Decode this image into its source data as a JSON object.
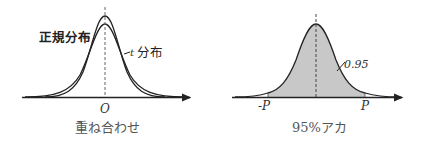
{
  "left_panel": {
    "normal_label": "正規分布",
    "t_label": "t",
    "t_label_suffix": "分布",
    "origin_label": "O",
    "caption": "重ね合わせ"
  },
  "right_panel": {
    "area_label": "0.95",
    "neg_p_label": "-P",
    "p_label": "P",
    "caption": "95%アカ"
  },
  "colors": {
    "stroke": "#222222",
    "shade": "#c8c8c8",
    "caption": "#555555"
  }
}
